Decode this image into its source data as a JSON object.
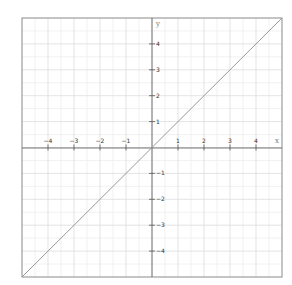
{
  "chart_data": {
    "type": "line",
    "title": "",
    "function": "y = x",
    "xlabel": "x",
    "ylabel": "y",
    "xlim": [
      -5,
      5
    ],
    "ylim": [
      -5,
      5
    ],
    "grid": true,
    "minor_grid_step": 0.5,
    "x_ticks": [
      -4,
      -3,
      -2,
      -1,
      1,
      2,
      3,
      4
    ],
    "y_ticks": [
      -4,
      -3,
      -2,
      -1,
      1,
      2,
      3,
      4
    ],
    "x_tick_labels": [
      "−4",
      "−3",
      "−2",
      "−1",
      "1",
      "2",
      "3",
      "4"
    ],
    "y_tick_labels": [
      "−4",
      "−3",
      "−2",
      "−1",
      "1",
      "2",
      "3",
      "4"
    ],
    "series": [
      {
        "name": "y = x",
        "x": [
          -5,
          5
        ],
        "y": [
          -5,
          5
        ],
        "color": "#999999"
      }
    ],
    "legend": null
  },
  "colors": {
    "frame": "#8a8a8a",
    "axis": "#555555",
    "major_grid": "#dcdcdc",
    "minor_grid": "#ededed",
    "line": "#9a9a9a"
  }
}
